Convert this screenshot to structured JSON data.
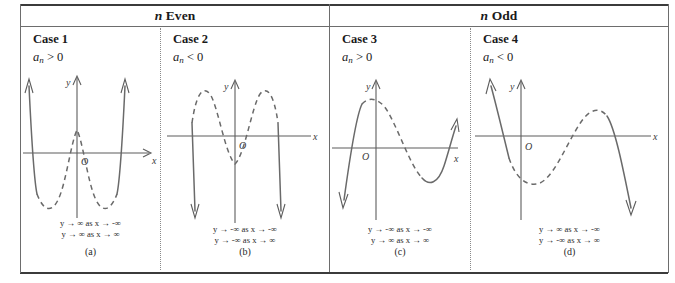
{
  "figure": {
    "groups": [
      {
        "prefix": "n",
        "label": "Even",
        "name": "n-even"
      },
      {
        "prefix": "n",
        "label": "Odd",
        "name": "n-odd"
      }
    ]
  },
  "cases": [
    {
      "title": "Case 1",
      "coefficient": "a",
      "subscript": "n",
      "relation": ">",
      "value": "0",
      "line1": "y → ∞ as x → -∞",
      "line2": "y → ∞ as x → ∞",
      "subcaption": "(a)",
      "axis_x_label": "x",
      "axis_y_label": "y",
      "origin_label": "O",
      "shape": "quartic-up"
    },
    {
      "title": "Case 2",
      "coefficient": "a",
      "subscript": "n",
      "relation": "<",
      "value": "0",
      "line1": "y → -∞ as x → -∞",
      "line2": "y → -∞ as x → ∞",
      "subcaption": "(b)",
      "axis_x_label": "x",
      "axis_y_label": "y",
      "origin_label": "O",
      "shape": "quartic-down"
    },
    {
      "title": "Case 3",
      "coefficient": "a",
      "subscript": "n",
      "relation": ">",
      "value": "0",
      "line1": "y → -∞ as x → -∞",
      "line2": "y → ∞ as x → ∞",
      "subcaption": "(c)",
      "axis_x_label": "x",
      "axis_y_label": "y",
      "origin_label": "O",
      "shape": "cubic-up"
    },
    {
      "title": "Case 4",
      "coefficient": "a",
      "subscript": "n",
      "relation": "<",
      "value": "0",
      "line1": "y → ∞ as x → -∞",
      "line2": "y → -∞ as x → ∞",
      "subcaption": "(d)",
      "axis_x_label": "x",
      "axis_y_label": "y",
      "origin_label": "O",
      "shape": "cubic-down"
    }
  ],
  "colors": {
    "rule": "#3b3b3b",
    "divider": "#6d6d6d",
    "curve": "#6a6a6a",
    "axis": "#5d5d5d",
    "text": "#1a1a1a"
  }
}
